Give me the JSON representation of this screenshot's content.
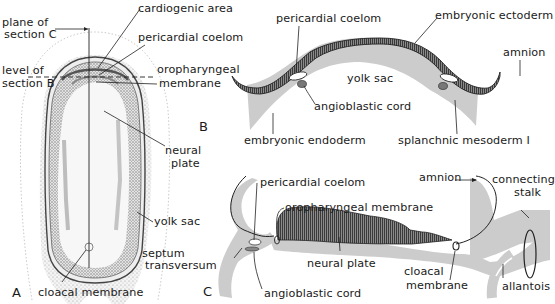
{
  "figure": {
    "panels": {
      "A": {
        "letter": "A",
        "labels": {
          "plane_c_1": "plane of",
          "plane_c_2": "section C",
          "level_b_1": "level of",
          "level_b_2": "section B",
          "cardiogenic": "cardiogenic area",
          "pericardial": "pericardial coelom",
          "oro_1": "oropharyngeal",
          "oro_2": "membrane",
          "neural_1": "neural",
          "neural_2": "plate",
          "yolk": "yolk sac",
          "cloacal": "cloacal membrane"
        }
      },
      "B": {
        "letter": "B",
        "labels": {
          "pericardial": "pericardial coelom",
          "ectoderm": "embryonic ectoderm",
          "amnion": "amnion",
          "yolk": "yolk sac",
          "angio": "angioblastic cord",
          "endoderm": "embryonic endoderm",
          "splanchnic": "splanchnic mesoderm I"
        }
      },
      "C": {
        "letter": "C",
        "labels": {
          "pericardial": "pericardial coelom",
          "oro": "oropharyngeal membrane",
          "amnion": "amnion",
          "stalk_1": "connecting",
          "stalk_2": "stalk",
          "septum_1": "septum",
          "septum_2": "transversum",
          "neural": "neural plate",
          "cloacal_1": "cloacal",
          "cloacal_2": "membrane",
          "allantois": "allantois",
          "angio": "angioblastic cord"
        }
      }
    },
    "colors": {
      "ink": "#1a1a1a",
      "mesoderm_gray": "#c9c9c9",
      "ectoderm_dark": "#555555",
      "stipple": "#9a9a9a"
    }
  }
}
